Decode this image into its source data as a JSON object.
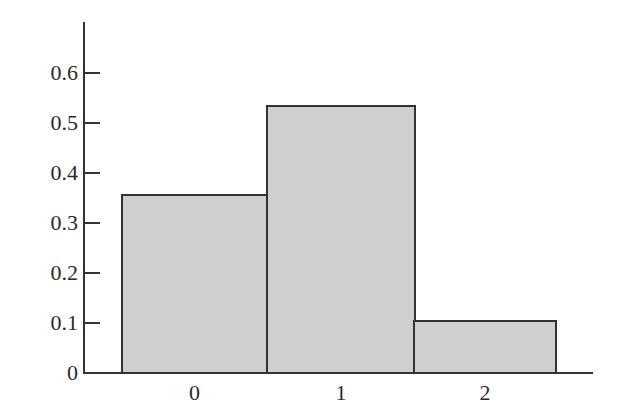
{
  "chart_data": {
    "type": "bar",
    "title": "",
    "xlabel": "",
    "ylabel": "",
    "categories": [
      "0",
      "1",
      "2"
    ],
    "values": [
      0.356,
      0.534,
      0.104
    ],
    "ylim": [
      0,
      0.7
    ],
    "yticks": [
      "0",
      "0.1",
      "0.2",
      "0.3",
      "0.4",
      "0.5",
      "0.6"
    ],
    "grid": false,
    "legend": null,
    "bar_fill": "#cfcfcf",
    "bar_edge": "#333333"
  }
}
